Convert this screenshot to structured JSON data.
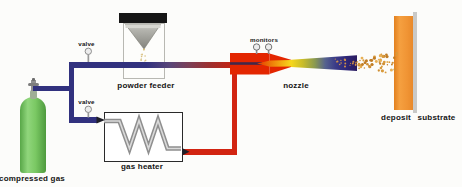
{
  "labels": {
    "compressed_gas": "compressed gas",
    "valve_top": "valve",
    "valve_bottom": "valve",
    "powder_feeder": "powder feeder",
    "gas_heater": "gas heater",
    "monitors": "monitors",
    "nozzle": "nozzle",
    "deposit": "deposit",
    "substrate": "substrate"
  },
  "colors": {
    "pipe_cold": "#31317e",
    "pipe_hot": "#d22411",
    "nozzle_red": "#e32600",
    "throat_yellow": "#f7d71c",
    "jet_dark": "#2a1b5e",
    "cylinder_green": "#7ac863",
    "deposit_orange": "#f09434",
    "substrate_gray": "#c9c9c7",
    "coil_gray": "#8f8f8f",
    "label_text": "#141414",
    "particle_orange": "#d89a3c"
  }
}
